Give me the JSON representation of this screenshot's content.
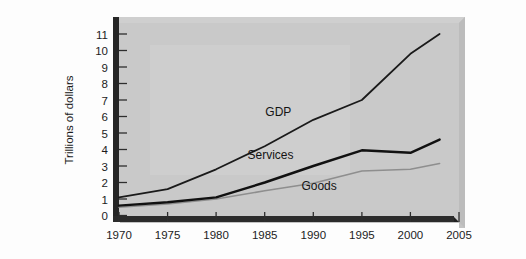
{
  "chart_data": {
    "type": "line",
    "title": "",
    "xlabel": "",
    "ylabel": "Trillions of dollars",
    "xlim": [
      1970,
      2005
    ],
    "ylim": [
      0,
      11.4
    ],
    "xticks": [
      "1970",
      "1975",
      "1980",
      "1985",
      "1990",
      "1995",
      "2000",
      "2005"
    ],
    "yticks": [
      "0",
      "1",
      "2",
      "3",
      "4",
      "5",
      "6",
      "7",
      "8",
      "9",
      "10",
      "11"
    ],
    "grid": false,
    "legend_position": "inline-annotations",
    "x": [
      1970,
      1975,
      1980,
      1985,
      1990,
      1995,
      2000,
      2003
    ],
    "series": [
      {
        "name": "GDP",
        "label": "GDP",
        "color": "#1a1a1a",
        "width": 1.8,
        "values": [
          1.1,
          1.6,
          2.8,
          4.2,
          5.8,
          7.0,
          9.8,
          11.0
        ]
      },
      {
        "name": "Services",
        "label": "Services",
        "color": "#111111",
        "width": 2.4,
        "values": [
          0.6,
          0.8,
          1.1,
          2.0,
          3.0,
          3.95,
          3.8,
          4.6
        ]
      },
      {
        "name": "Goods",
        "label": "Goods",
        "color": "#8e8e8e",
        "width": 1.6,
        "values": [
          0.5,
          0.7,
          1.0,
          1.5,
          1.95,
          2.7,
          2.8,
          3.15
        ]
      }
    ],
    "annotations": [
      {
        "text": "GDP",
        "x": 1986.4,
        "y": 6.05
      },
      {
        "text": "Services",
        "x": 1985.6,
        "y": 3.45
      },
      {
        "text": "Goods",
        "x": 1990.6,
        "y": 1.55
      }
    ]
  },
  "panel": {
    "background": "#c9c9c9",
    "axis_color": "#2a2a2a",
    "shadow_color": "#bdbdbd"
  }
}
